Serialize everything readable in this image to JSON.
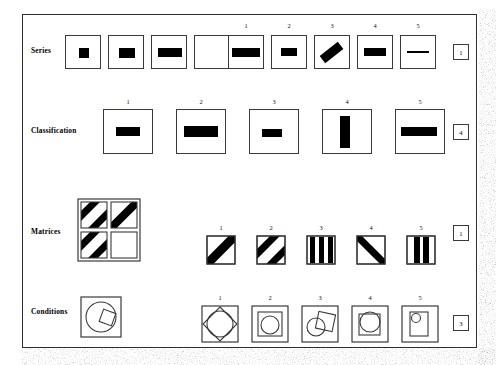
{
  "page": {
    "border_color": "#2e2e2e"
  },
  "rows": [
    {
      "label": "Series",
      "answer": "1",
      "problem_count": 4,
      "option_numbers": [
        "1",
        "2",
        "3",
        "4",
        "5"
      ],
      "problem_bars": [
        {
          "w": 10,
          "h": 10,
          "angle": 0
        },
        {
          "w": 16,
          "h": 10,
          "angle": 0
        },
        {
          "w": 24,
          "h": 9,
          "angle": 0
        },
        {
          "w": 0,
          "h": 0,
          "angle": 0
        }
      ],
      "option_bars": [
        {
          "w": 28,
          "h": 9,
          "angle": 0
        },
        {
          "w": 16,
          "h": 8,
          "angle": 0
        },
        {
          "w": 22,
          "h": 8,
          "angle": -38
        },
        {
          "w": 22,
          "h": 8,
          "angle": 0
        },
        {
          "w": 22,
          "h": 2,
          "angle": 0
        }
      ]
    },
    {
      "label": "Classification",
      "answer": "4",
      "option_numbers": [
        "1",
        "2",
        "3",
        "4",
        "5"
      ],
      "option_bars": [
        {
          "w": 24,
          "h": 9,
          "vertical": false
        },
        {
          "w": 34,
          "h": 11,
          "vertical": false
        },
        {
          "w": 20,
          "h": 8,
          "vertical": false
        },
        {
          "w": 10,
          "h": 32,
          "vertical": true
        },
        {
          "w": 36,
          "h": 9,
          "vertical": false
        }
      ]
    },
    {
      "label": "Matrices",
      "answer": "1",
      "matrix_cells": [
        "two-diagonals",
        "one-diagonal",
        "two-diagonals",
        "blank"
      ],
      "option_numbers": [
        "1",
        "2",
        "3",
        "4",
        "5"
      ],
      "option_patterns": [
        "one-diagonal-up",
        "two-diagonals-up",
        "three-vertical-bars",
        "one-diagonal-down",
        "two-vertical-bars"
      ]
    },
    {
      "label": "Conditions",
      "answer": "3",
      "problem_shape": "circle-with-small-tilted-square",
      "option_numbers": [
        "1",
        "2",
        "3",
        "4",
        "5"
      ],
      "option_shapes": [
        "diamond-over-circle",
        "square-with-circle-inside",
        "circle-overlapping-tilted-square",
        "square-with-overlapping-circle",
        "rectangle-with-small-circle"
      ]
    }
  ]
}
